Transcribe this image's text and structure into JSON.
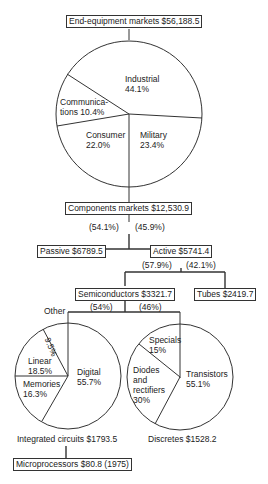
{
  "title_box": "End-equipment markets $56,188.5",
  "end_equipment_pie": {
    "slices": [
      {
        "name": "Industrial",
        "line1": "Industrial",
        "line2": "44.1%",
        "value": 44.1
      },
      {
        "name": "Military",
        "line1": "Military",
        "line2": "23.4%",
        "value": 23.4
      },
      {
        "name": "Consumer",
        "line1": "Consumer",
        "line2": "22.0%",
        "value": 22.0
      },
      {
        "name": "Communications",
        "line1": "Communica-",
        "line2": "tions 10.4%",
        "value": 10.4
      }
    ]
  },
  "components_box": "Components markets $12,530.9",
  "components_split": {
    "left_pct": "(54.1%)",
    "right_pct": "(45.9%)"
  },
  "passive_box": "Passive $6789.5",
  "active_box": "Active $5741.4",
  "active_split": {
    "left_pct": "(57.9%)",
    "right_pct": "(42.1%)"
  },
  "semiconductors_box": "Semiconductors $3321.7",
  "tubes_box": "Tubes $2419.7",
  "semiconductors_split": {
    "left_pct": "(54%)",
    "right_pct": "(46%)"
  },
  "ic_pie": {
    "other_label": "Other",
    "slices": [
      {
        "name": "Digital",
        "line1": "Digital",
        "line2": "55.7%",
        "value": 55.7
      },
      {
        "name": "Memories",
        "line1": "Memories",
        "line2": "16.3%",
        "value": 16.3
      },
      {
        "name": "Linear",
        "line1": "Linear",
        "line2": "18.5%",
        "value": 18.5
      },
      {
        "name": "Other",
        "line1": "9.5%",
        "value": 9.5
      }
    ],
    "caption": "Integrated circuits $1793.5"
  },
  "discretes_pie": {
    "slices": [
      {
        "name": "Transistors",
        "line1": "Transistors",
        "line2": "55.1%",
        "value": 55.1
      },
      {
        "name": "Diodes and rectifiers",
        "line1": "Diodes",
        "line2": "and",
        "line3": "rectifiers",
        "line4": "30%",
        "value": 30
      },
      {
        "name": "Specials",
        "line1": "Specials",
        "line2": "15%",
        "value": 15
      }
    ],
    "caption": "Discretes $1528.2"
  },
  "microprocessors_box": "Microprocessors $80.8 (1975)"
}
